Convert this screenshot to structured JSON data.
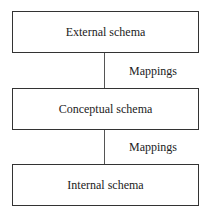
{
  "diagram": {
    "boxes": [
      {
        "label": "External schema"
      },
      {
        "label": "Conceptual schema"
      },
      {
        "label": "Internal schema"
      }
    ],
    "connectors": [
      {
        "label": "Mappings"
      },
      {
        "label": "Mappings"
      }
    ]
  }
}
